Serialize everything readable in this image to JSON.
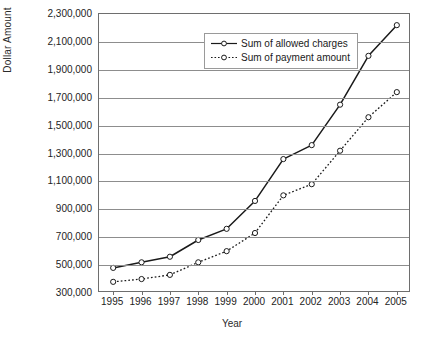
{
  "chart_data": {
    "type": "line",
    "title": "",
    "xlabel": "Year",
    "ylabel": "Dollar Amount",
    "categories": [
      "1995",
      "1996",
      "1997",
      "1998",
      "1999",
      "2000",
      "2001",
      "2002",
      "2003",
      "2004",
      "2005"
    ],
    "x": [
      1995,
      1996,
      1997,
      1998,
      1999,
      2000,
      2001,
      2002,
      2003,
      2004,
      2005
    ],
    "ylim": [
      300000,
      2300000
    ],
    "ytick_values": [
      300000,
      500000,
      700000,
      900000,
      1100000,
      1300000,
      1500000,
      1700000,
      1900000,
      2100000,
      2300000
    ],
    "ytick_labels": [
      "300,000",
      "500,000",
      "700,000",
      "900,000",
      "1,100,000",
      "1,300,000",
      "1,500,000",
      "1,700,000",
      "1,900,000",
      "2,100,000",
      "2,300,000"
    ],
    "grid": true,
    "legend_position": "top-left",
    "series": [
      {
        "name": "Sum of allowed charges",
        "style": "solid",
        "marker": "open-circle",
        "color": "#1a1a1a",
        "values": [
          480000,
          520000,
          560000,
          680000,
          760000,
          960000,
          1260000,
          1360000,
          1650000,
          2000000,
          2220000
        ]
      },
      {
        "name": "Sum of payment amount",
        "style": "dotted",
        "marker": "open-circle",
        "color": "#1a1a1a",
        "values": [
          380000,
          400000,
          430000,
          520000,
          600000,
          730000,
          1000000,
          1080000,
          1320000,
          1560000,
          1740000
        ]
      }
    ]
  },
  "legend": {
    "items": [
      {
        "label": "Sum of allowed charges"
      },
      {
        "label": "Sum of payment amount"
      }
    ]
  }
}
